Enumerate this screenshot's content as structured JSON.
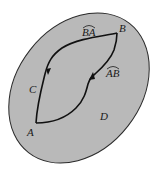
{
  "diagram": {
    "colors": {
      "background": "#ffffff",
      "region_fill": "#b9b9b9",
      "region_outline": "#2a2a2a",
      "path_stroke": "#111111"
    },
    "region": {
      "label": "D"
    },
    "points": [
      {
        "id": "A",
        "label": "A"
      },
      {
        "id": "B",
        "label": "B"
      },
      {
        "id": "C",
        "label": "C"
      }
    ],
    "arcs": [
      {
        "id": "BA",
        "label": "BA",
        "from": "B",
        "to": "A",
        "via": "C"
      },
      {
        "id": "AB",
        "label": "AB",
        "from": "A",
        "to": "B"
      }
    ]
  }
}
